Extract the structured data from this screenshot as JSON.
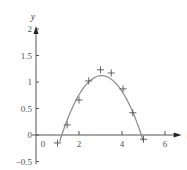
{
  "chart_data": {
    "type": "scatter",
    "title": "",
    "xlabel": "t",
    "ylabel": "y",
    "xlim": [
      0,
      6
    ],
    "ylim": [
      -0.5,
      2
    ],
    "x_ticks": [
      2,
      4,
      6
    ],
    "x_tick_labels": [
      "0",
      "2",
      "4",
      "6"
    ],
    "y_ticks": [
      -0.5,
      0,
      0.5,
      1,
      1.5,
      2
    ],
    "y_tick_labels": [
      "−0.5",
      "0",
      "0.5",
      "1",
      "1.5",
      "2"
    ],
    "grid": false,
    "legend": null,
    "series": [
      {
        "name": "data points",
        "marker": "+",
        "x": [
          1.0,
          1.45,
          2.0,
          2.45,
          3.0,
          3.5,
          4.05,
          4.5,
          5.0
        ],
        "y": [
          -0.15,
          0.19,
          0.66,
          1.02,
          1.23,
          1.17,
          0.87,
          0.42,
          -0.08
        ]
      },
      {
        "name": "fitted parabola",
        "type": "line",
        "equation": "y = -0.327 (t - 1.2)(t - 4.9)",
        "x_range": [
          1.1,
          5.0
        ],
        "roots": [
          1.2,
          4.9
        ],
        "peak": {
          "t": 3.05,
          "y": 1.12
        }
      }
    ]
  },
  "colors": {
    "axis": "#555555",
    "curve": "#8a8a8a",
    "marker": "#555555"
  }
}
